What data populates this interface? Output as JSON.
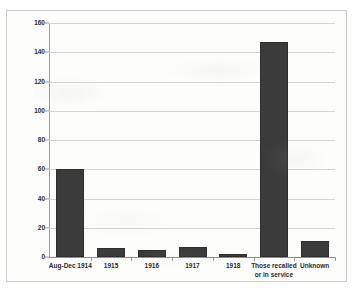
{
  "chart_data": {
    "type": "bar",
    "title": "",
    "subtitle": "",
    "xlabel": "",
    "ylabel": "",
    "categories": [
      "Aug-Dec 1914",
      "1915",
      "1916",
      "1917",
      "1918",
      "Those recalled\nor in service",
      "Unknown"
    ],
    "values": [
      60,
      6,
      5,
      7,
      2,
      147,
      11
    ],
    "ylim": [
      0,
      160
    ],
    "ytick_labels": [
      "0",
      "20",
      "40",
      "60",
      "80",
      "100",
      "120",
      "140",
      "160"
    ],
    "ytick_values": [
      0,
      20,
      40,
      60,
      80,
      100,
      120,
      140,
      160
    ],
    "grid": true,
    "legend": false,
    "legend_position": "none",
    "bar_color": "#3b3b3b",
    "gridline_color": "#d2d2d0",
    "axis_color": "#9a9a98",
    "plot_background": "#fdfdfc",
    "border_color": "#c9c9c7"
  }
}
